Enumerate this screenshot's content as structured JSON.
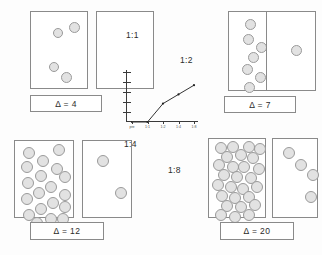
{
  "figure": {
    "title": "",
    "background": "#fdfdfd",
    "dot_fill": "#e2e2e2",
    "dot_stroke": "#9a9a9a",
    "panel_stroke": "#8a8a8a"
  },
  "quadrants": [
    {
      "id": "top-left",
      "ratio_label": "1:1",
      "delta_label": "Δ = 4",
      "delta_value": 4,
      "left_panel_count": 4,
      "right_panel_count": 0,
      "left_dots": [
        {
          "x": 22,
          "y": 16,
          "r": 5
        },
        {
          "x": 38,
          "y": 10,
          "r": 5.5
        },
        {
          "x": 18,
          "y": 50,
          "r": 5
        },
        {
          "x": 30,
          "y": 60,
          "r": 5.5
        }
      ],
      "right_dots": []
    },
    {
      "id": "top-right",
      "ratio_label": "1:2",
      "delta_label": "Δ = 7",
      "delta_value": 7,
      "left_panel_count": 7,
      "right_panel_count": 1,
      "left_dots": [
        {
          "x": 16,
          "y": 7,
          "r": 5.5
        },
        {
          "x": 14,
          "y": 22,
          "r": 5.5
        },
        {
          "x": 27,
          "y": 30,
          "r": 5.5
        },
        {
          "x": 19,
          "y": 40,
          "r": 5.5
        },
        {
          "x": 13,
          "y": 52,
          "r": 5.5
        },
        {
          "x": 26,
          "y": 60,
          "r": 5.5
        },
        {
          "x": 15,
          "y": 70,
          "r": 5.5
        }
      ],
      "right_dots": [
        {
          "x": 24,
          "y": 33,
          "r": 5.5
        }
      ]
    },
    {
      "id": "bottom-left",
      "ratio_label": "1:4",
      "delta_label": "Δ = 12",
      "delta_value": 12,
      "left_panel_count": 19,
      "right_panel_count": 2,
      "left_dots": [
        {
          "x": 8,
          "y": 6,
          "r": 6
        },
        {
          "x": 38,
          "y": 3,
          "r": 6
        },
        {
          "x": 22,
          "y": 14,
          "r": 6
        },
        {
          "x": 6,
          "y": 20,
          "r": 6
        },
        {
          "x": 36,
          "y": 22,
          "r": 6
        },
        {
          "x": 20,
          "y": 29,
          "r": 6
        },
        {
          "x": 44,
          "y": 30,
          "r": 6
        },
        {
          "x": 7,
          "y": 36,
          "r": 6
        },
        {
          "x": 30,
          "y": 40,
          "r": 6
        },
        {
          "x": 18,
          "y": 46,
          "r": 6
        },
        {
          "x": 44,
          "y": 48,
          "r": 6
        },
        {
          "x": 6,
          "y": 52,
          "r": 6
        },
        {
          "x": 32,
          "y": 56,
          "r": 6
        },
        {
          "x": 20,
          "y": 62,
          "r": 6
        },
        {
          "x": 44,
          "y": 60,
          "r": 6
        },
        {
          "x": 8,
          "y": 68,
          "r": 6
        },
        {
          "x": 30,
          "y": 72,
          "r": 6
        },
        {
          "x": 42,
          "y": 72,
          "r": 6
        },
        {
          "x": 16,
          "y": 76,
          "r": 6
        }
      ],
      "right_dots": [
        {
          "x": 14,
          "y": 14,
          "r": 6
        },
        {
          "x": 32,
          "y": 46,
          "r": 6
        }
      ]
    },
    {
      "id": "bottom-right",
      "ratio_label": "1:8",
      "delta_label": "Δ = 20",
      "delta_value": 20,
      "left_panel_count": 27,
      "right_panel_count": 4,
      "left_dots": [
        {
          "x": 6,
          "y": 3,
          "r": 6
        },
        {
          "x": 18,
          "y": 2,
          "r": 6
        },
        {
          "x": 34,
          "y": 2,
          "r": 6
        },
        {
          "x": 45,
          "y": 4,
          "r": 6
        },
        {
          "x": 12,
          "y": 12,
          "r": 6
        },
        {
          "x": 26,
          "y": 10,
          "r": 6
        },
        {
          "x": 38,
          "y": 13,
          "r": 6
        },
        {
          "x": 4,
          "y": 20,
          "r": 6
        },
        {
          "x": 18,
          "y": 22,
          "r": 6
        },
        {
          "x": 29,
          "y": 22,
          "r": 6
        },
        {
          "x": 44,
          "y": 24,
          "r": 6
        },
        {
          "x": 9,
          "y": 30,
          "r": 6
        },
        {
          "x": 22,
          "y": 32,
          "r": 6
        },
        {
          "x": 36,
          "y": 33,
          "r": 6
        },
        {
          "x": 3,
          "y": 40,
          "r": 6
        },
        {
          "x": 16,
          "y": 42,
          "r": 6
        },
        {
          "x": 28,
          "y": 44,
          "r": 6
        },
        {
          "x": 42,
          "y": 42,
          "r": 6
        },
        {
          "x": 7,
          "y": 51,
          "r": 6
        },
        {
          "x": 20,
          "y": 53,
          "r": 6
        },
        {
          "x": 34,
          "y": 52,
          "r": 6
        },
        {
          "x": 12,
          "y": 61,
          "r": 6
        },
        {
          "x": 26,
          "y": 62,
          "r": 6
        },
        {
          "x": 40,
          "y": 60,
          "r": 6
        },
        {
          "x": 6,
          "y": 70,
          "r": 6
        },
        {
          "x": 20,
          "y": 72,
          "r": 6
        },
        {
          "x": 34,
          "y": 70,
          "r": 6
        }
      ],
      "right_dots": [
        {
          "x": 10,
          "y": 8,
          "r": 6
        },
        {
          "x": 22,
          "y": 20,
          "r": 6
        },
        {
          "x": 34,
          "y": 30,
          "r": 6
        },
        {
          "x": 32,
          "y": 52,
          "r": 6
        }
      ]
    }
  ],
  "chart_data": {
    "type": "line",
    "title": "",
    "xlabel": "",
    "ylabel": "",
    "categories": [
      "pre",
      "1:1",
      "1:2",
      "1:4",
      "1:8"
    ],
    "tick_labels": [
      "pre",
      "1:1",
      "1:2",
      "1:4",
      "1:8"
    ],
    "series": [
      {
        "name": "response",
        "values": [
          0,
          0,
          2,
          3,
          4
        ]
      }
    ],
    "ylim": [
      0,
      5
    ],
    "y_tick_count": 5,
    "grid": false,
    "legend": "none",
    "markers": true
  }
}
